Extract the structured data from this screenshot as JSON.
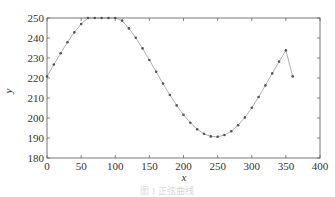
{
  "chart_data": {
    "type": "line",
    "title": "",
    "xlabel": "x",
    "ylabel": "y",
    "xlim": [
      0,
      400
    ],
    "ylim": [
      180,
      250
    ],
    "xticks": [
      0,
      50,
      100,
      150,
      200,
      250,
      300,
      350,
      400
    ],
    "yticks": [
      180,
      190,
      200,
      210,
      220,
      230,
      240,
      250
    ],
    "grid": false,
    "legend": null,
    "series": [
      {
        "name": "y",
        "marker": "dot",
        "line_color": "#9a9a9a",
        "marker_color": "#555555",
        "x": [
          0,
          10,
          20,
          30,
          40,
          50,
          60,
          70,
          80,
          90,
          100,
          110,
          120,
          130,
          140,
          150,
          160,
          170,
          180,
          190,
          200,
          210,
          220,
          230,
          240,
          250,
          260,
          270,
          280,
          290,
          300,
          310,
          320,
          330,
          340,
          350,
          360
        ],
        "values": [
          220.8,
          226.7,
          232.4,
          237.9,
          242.8,
          247.0,
          250.0,
          252.0,
          253.0,
          252.8,
          251.5,
          248.7,
          244.8,
          240.1,
          234.8,
          229.0,
          223.1,
          217.2,
          211.5,
          206.3,
          201.6,
          197.6,
          194.4,
          192.1,
          190.8,
          190.6,
          191.5,
          193.4,
          196.4,
          200.3,
          205.1,
          210.5,
          216.3,
          222.3,
          228.2,
          233.8,
          220.8
        ]
      }
    ]
  },
  "caption": "图 1  正弦曲线"
}
